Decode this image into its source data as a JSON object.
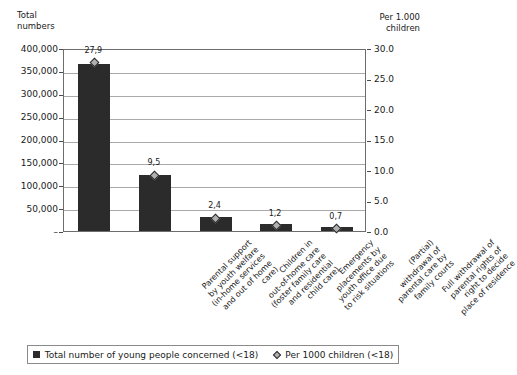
{
  "chart_data": {
    "type": "bar",
    "title": "",
    "subtitle": "",
    "xlabel": "",
    "ylabel": "Total\nnumbers",
    "ylabel_right": "Per 1.000\nchildren",
    "grid": true,
    "legend_position": "bottom",
    "ylim": [
      0,
      400000
    ],
    "ylim_right": [
      0,
      30.0
    ],
    "yticks": [
      "–",
      "50,000",
      "100,000",
      "150,000",
      "200,000",
      "250,000",
      "300,000",
      "350,000",
      "400,000"
    ],
    "ytick_values": [
      0,
      50000,
      100000,
      150000,
      200000,
      250000,
      300000,
      350000,
      400000
    ],
    "yticks_right": [
      "0.0",
      "5.0",
      "10.0",
      "15.0",
      "20.0",
      "25.0",
      "30.0"
    ],
    "ytick_values_right": [
      0,
      5,
      10,
      15,
      20,
      25,
      30
    ],
    "categories": [
      "Parental support\nby youth welfare\n(in-home services\nand out of home\ncare)",
      "Children in\nout-of-home care\n(foster family care\nand residential\nchild care)",
      "Emergency\nplacements by\nyouth office due\nto risk situations",
      "(Partial)\nwithdrawal of\nparental care by\nfamily courts",
      "Full withdrawal of\nparental rights of\nright to decide\nplace of residence"
    ],
    "series": [
      {
        "name": "Total number of young people concerned (<18)",
        "type": "bar",
        "axis": "left",
        "color": "#2b2b2b",
        "values": [
          365000,
          123000,
          31000,
          15000,
          9000
        ]
      },
      {
        "name": "Per 1000 children (<18)",
        "type": "marker",
        "axis": "right",
        "color": "#b0b0b0",
        "values": [
          27.9,
          9.5,
          2.4,
          1.2,
          0.7
        ],
        "data_labels": [
          "27,9",
          "9,5",
          "2,4",
          "1,2",
          "0,7"
        ]
      }
    ],
    "legend": [
      {
        "label": "Total number of young people concerned (<18)",
        "marker": "square",
        "color": "#2b2b2b"
      },
      {
        "label": "Per 1000 children (<18)",
        "marker": "diamond",
        "color": "#b0b0b0"
      }
    ]
  },
  "colors": {
    "bar": "#2b2b2b",
    "marker_fill": "#b0b0b0",
    "marker_edge": "#2b2b2b",
    "gridline": "#a9a9a9",
    "frame": "#6d6d6d",
    "text": "#1a1a1a",
    "background": "#ffffff"
  }
}
